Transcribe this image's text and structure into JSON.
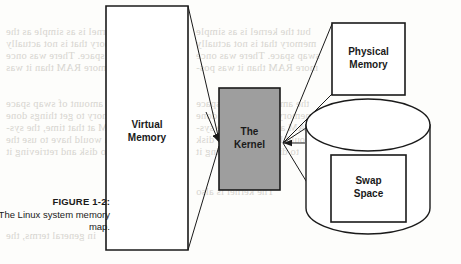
{
  "figure": {
    "caption_number": "FIGURE 1-2:",
    "caption_text": "The Linux system memory map."
  },
  "diagram": {
    "type": "block-diagram",
    "nodes": [
      {
        "id": "virtual-memory",
        "label_line1": "Virtual",
        "label_line2": "Memory",
        "shape": "rect",
        "fill": "#ffffff",
        "stroke": "#1a1a1a"
      },
      {
        "id": "kernel",
        "label_line1": "The",
        "label_line2": "Kernel",
        "shape": "rect",
        "fill": "#9e9e9e",
        "stroke": "#1a1a1a"
      },
      {
        "id": "physical-memory",
        "label_line1": "Physical",
        "label_line2": "Memory",
        "shape": "rect",
        "fill": "#ffffff",
        "stroke": "#1a1a1a"
      },
      {
        "id": "swap-space",
        "label_line1": "Swap",
        "label_line2": "Space",
        "shape": "rect",
        "fill": "#ffffff",
        "stroke": "#1a1a1a"
      },
      {
        "id": "disk",
        "label_line1": "",
        "label_line2": "",
        "shape": "cylinder",
        "fill": "#ffffff",
        "stroke": "#1a1a1a"
      }
    ],
    "edges": [
      {
        "from": "virtual-memory",
        "to": "kernel",
        "arrow": "to"
      },
      {
        "from": "kernel",
        "to": "physical-memory",
        "arrow": "from"
      },
      {
        "from": "kernel",
        "to": "disk",
        "arrow": "from"
      }
    ]
  },
  "bleed_text": {
    "lines": [
      {
        "x": 6,
        "y": 26,
        "text": "the kernel is as simple as the"
      },
      {
        "x": 6,
        "y": 38,
        "text": "to memory that is not actually"
      },
      {
        "x": 6,
        "y": 50,
        "text": "the swap space. There was once"
      },
      {
        "x": 6,
        "y": 62,
        "text": "much more RAM than it was"
      },
      {
        "x": 6,
        "y": 98,
        "text": "and the amount of swap space"
      },
      {
        "x": 6,
        "y": 110,
        "text": "to memory to get things done"
      },
      {
        "x": 6,
        "y": 122,
        "text": "in RAM at that time, the sys-"
      },
      {
        "x": 6,
        "y": 134,
        "text": "tem would have to use the"
      },
      {
        "x": 6,
        "y": 146,
        "text": "data to disk and retrieving it"
      },
      {
        "x": 196,
        "y": 26,
        "text": "but the kernel is as simple"
      },
      {
        "x": 196,
        "y": 38,
        "text": "memory that is not actually"
      },
      {
        "x": 196,
        "y": 50,
        "text": "swap space. There was once"
      },
      {
        "x": 196,
        "y": 62,
        "text": "more RAM than it was pos-"
      },
      {
        "x": 196,
        "y": 98,
        "text": "the amount of swap space"
      },
      {
        "x": 196,
        "y": 110,
        "text": "memory to get things done"
      },
      {
        "x": 196,
        "y": 122,
        "text": "RAM at that time, the sys-"
      },
      {
        "x": 196,
        "y": 134,
        "text": "would have to use the disk"
      },
      {
        "x": 196,
        "y": 146,
        "text": "to disk and retrieving it"
      },
      {
        "x": 196,
        "y": 186,
        "text": "The kernel is also"
      },
      {
        "x": 6,
        "y": 230,
        "text": "in general terms, the"
      }
    ]
  }
}
